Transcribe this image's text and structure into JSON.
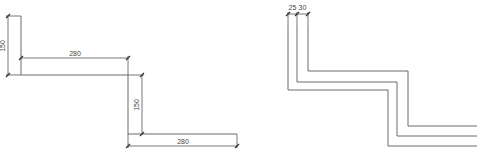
{
  "left_drawing": {
    "name": "step-profile-dimensioned",
    "dimensions": {
      "top_rise": "150",
      "top_run": "280",
      "middle_rise": "150",
      "bottom_run": "280"
    }
  },
  "right_drawing": {
    "name": "step-profile-offset-lines",
    "dimensions": {
      "offset_1": "25",
      "offset_2": "30"
    }
  },
  "colors": {
    "line": "#6a6a6a",
    "dimension": "#555555",
    "text": "#444444"
  }
}
